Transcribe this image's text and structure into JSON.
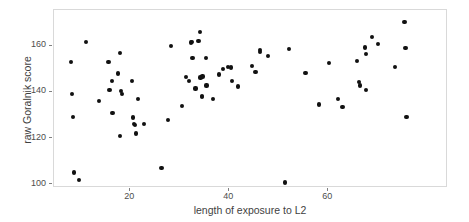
{
  "chart_data": {
    "type": "scatter",
    "title": "",
    "xlabel": "length of exposure to L2",
    "ylabel": "raw Goralnik score",
    "xlim": [
      4.6,
      84.2
    ],
    "ylim": [
      98.3,
      175.6
    ],
    "xticks": [
      20,
      40,
      60
    ],
    "xtick_labels": [
      "20",
      "40",
      "60"
    ],
    "yticks": [
      100,
      120,
      140,
      160
    ],
    "ytick_labels": [
      "100",
      "120",
      "140",
      "160"
    ],
    "grid": false,
    "legend": null,
    "marker": {
      "shape": "circle",
      "color": "#111111",
      "size": 4.2
    },
    "panel_border_color": "#d9d9d9",
    "background": "#ffffff",
    "n_points": 84,
    "points": [
      [
        8.0,
        153.0
      ],
      [
        8.3,
        139.0
      ],
      [
        8.4,
        129.0
      ],
      [
        8.6,
        105.0
      ],
      [
        9.6,
        101.7
      ],
      [
        11.0,
        161.7
      ],
      [
        13.7,
        136.0
      ],
      [
        15.6,
        153.0
      ],
      [
        15.8,
        140.7
      ],
      [
        16.3,
        144.6
      ],
      [
        16.4,
        130.8
      ],
      [
        17.5,
        148.0
      ],
      [
        17.9,
        157.0
      ],
      [
        18.2,
        140.3
      ],
      [
        18.3,
        139.2
      ],
      [
        18.0,
        121.0
      ],
      [
        20.4,
        144.8
      ],
      [
        20.6,
        128.9
      ],
      [
        20.8,
        126.0
      ],
      [
        21.0,
        125.6
      ],
      [
        21.1,
        122.0
      ],
      [
        21.6,
        137.0
      ],
      [
        22.8,
        126.0
      ],
      [
        26.3,
        107.0
      ],
      [
        27.7,
        128.0
      ],
      [
        28.2,
        159.8
      ],
      [
        30.4,
        134.0
      ],
      [
        31.3,
        146.6
      ],
      [
        31.9,
        144.8
      ],
      [
        32.2,
        161.5
      ],
      [
        32.4,
        161.8
      ],
      [
        32.6,
        154.8
      ],
      [
        33.2,
        141.5
      ],
      [
        33.8,
        162.0
      ],
      [
        34.1,
        166.0
      ],
      [
        34.2,
        146.3
      ],
      [
        34.6,
        146.7
      ],
      [
        34.5,
        138.4
      ],
      [
        34.5,
        137.8
      ],
      [
        35.3,
        154.7
      ],
      [
        35.4,
        142.8
      ],
      [
        36.8,
        136.9
      ],
      [
        37.9,
        147.6
      ],
      [
        38.7,
        150.0
      ],
      [
        39.8,
        150.7
      ],
      [
        40.4,
        150.6
      ],
      [
        40.6,
        144.6
      ],
      [
        41.8,
        142.4
      ],
      [
        44.6,
        151.3
      ],
      [
        45.3,
        148.6
      ],
      [
        46.2,
        158.2
      ],
      [
        46.2,
        157.3
      ],
      [
        47.9,
        155.6
      ],
      [
        51.2,
        100.7
      ],
      [
        52.1,
        158.6
      ],
      [
        55.4,
        148.4
      ],
      [
        58.2,
        134.6
      ],
      [
        60.2,
        152.5
      ],
      [
        61.9,
        136.8
      ],
      [
        62.9,
        133.6
      ],
      [
        65.8,
        153.5
      ],
      [
        66.3,
        144.5
      ],
      [
        66.5,
        142.8
      ],
      [
        67.5,
        159.3
      ],
      [
        67.6,
        156.4
      ],
      [
        67.7,
        141.0
      ],
      [
        68.8,
        163.8
      ],
      [
        70.0,
        161.0
      ],
      [
        73.5,
        151.0
      ],
      [
        75.4,
        170.5
      ],
      [
        75.6,
        159.0
      ],
      [
        75.8,
        129.2
      ]
    ]
  },
  "axes": {
    "x_title": "length of exposure to L2",
    "y_title": "raw Goralnik score"
  }
}
